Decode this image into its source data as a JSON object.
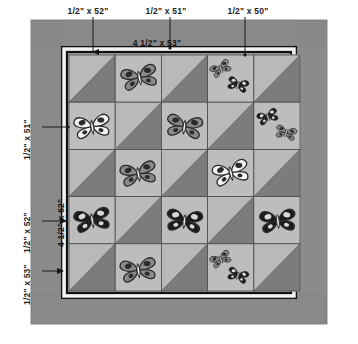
{
  "diagram": {
    "type": "quilt-assembly-diagram",
    "background_color": "#ffffff"
  },
  "labels": {
    "top": [
      {
        "text": "1/2\" x 52\"",
        "x": 88,
        "y": 6
      },
      {
        "text": "1/2\" x 51\"",
        "x": 166,
        "y": 6
      },
      {
        "text": "1/2\" x 50\"",
        "x": 248,
        "y": 6
      }
    ],
    "inner_top": {
      "text": "4 1/2\" x 53\"",
      "x": 157,
      "y": 38
    },
    "left": [
      {
        "text": "1/2\" x 51\"",
        "x": 22,
        "y": 160
      },
      {
        "text": "1/2\" x 52\"",
        "x": 22,
        "y": 253
      },
      {
        "text": "1/2\" x 53\"",
        "x": 22,
        "y": 305
      }
    ],
    "inner_left": {
      "text": "4 1/2\" x 62\"",
      "x": 56,
      "y": 247
    }
  },
  "colors": {
    "page": "#ffffff",
    "outer_border": "#8f8f8f",
    "outer_border_shade": "#848484",
    "rule_black": "#121212",
    "inner_white": "#f2f2f2",
    "block_light": "#b9b9b9",
    "block_light_alt": "#bdbdbd",
    "triangle_dark": "#7c7c7c",
    "grid_line": "#4a4a4a",
    "butterfly_white": "#f4f4f4",
    "butterfly_gray": "#8a8a8a",
    "butterfly_black": "#1c1c1c",
    "butterfly_outline": "#2a2a2a",
    "spot_dark": "#2b2b2b",
    "leader_line": "#1a1a1a"
  },
  "quilt": {
    "outer_border_rect": {
      "x": 31,
      "y": 20,
      "width": 296,
      "height": 304
    },
    "rule_outer_rect": {
      "x": 62,
      "y": 47,
      "width": 234,
      "height": 251
    },
    "white_strip_rect": {
      "x": 64,
      "y": 49,
      "width": 230,
      "height": 247
    },
    "rule_inner_rect": {
      "x": 67,
      "y": 52,
      "width": 224,
      "height": 241
    },
    "grid": {
      "x": 69,
      "y": 55,
      "cell_w": 46.2,
      "cell_h": 47.2,
      "cols": 5,
      "rows": 5
    }
  },
  "blocks": [
    {
      "row": 0,
      "col": 0,
      "kind": "triangle",
      "diagonal": "dark-lower-right",
      "butterflies": []
    },
    {
      "row": 0,
      "col": 1,
      "kind": "plain",
      "butterflies": [
        {
          "tone": "gray",
          "size": "large",
          "rot": -12,
          "cx": 0.52,
          "cy": 0.46
        }
      ]
    },
    {
      "row": 0,
      "col": 2,
      "kind": "triangle",
      "diagonal": "dark-lower-right",
      "butterflies": []
    },
    {
      "row": 0,
      "col": 3,
      "kind": "plain",
      "butterflies": [
        {
          "tone": "gray",
          "size": "small",
          "rot": -28,
          "cx": 0.28,
          "cy": 0.28
        },
        {
          "tone": "black",
          "size": "small",
          "rot": 16,
          "cx": 0.66,
          "cy": 0.62
        }
      ]
    },
    {
      "row": 0,
      "col": 4,
      "kind": "triangle",
      "diagonal": "dark-lower-right",
      "butterflies": []
    },
    {
      "row": 1,
      "col": 0,
      "kind": "plain",
      "butterflies": [
        {
          "tone": "white",
          "size": "large",
          "rot": -8,
          "cx": 0.5,
          "cy": 0.5
        }
      ]
    },
    {
      "row": 1,
      "col": 1,
      "kind": "triangle",
      "diagonal": "dark-lower-right",
      "butterflies": []
    },
    {
      "row": 1,
      "col": 2,
      "kind": "plain",
      "butterflies": [
        {
          "tone": "gray",
          "size": "large",
          "rot": 8,
          "cx": 0.5,
          "cy": 0.5
        }
      ]
    },
    {
      "row": 1,
      "col": 3,
      "kind": "triangle",
      "diagonal": "dark-lower-right",
      "butterflies": []
    },
    {
      "row": 1,
      "col": 4,
      "kind": "plain",
      "butterflies": [
        {
          "tone": "black",
          "size": "small",
          "rot": -20,
          "cx": 0.3,
          "cy": 0.3
        },
        {
          "tone": "gray",
          "size": "small",
          "rot": 14,
          "cx": 0.7,
          "cy": 0.64
        }
      ]
    },
    {
      "row": 2,
      "col": 0,
      "kind": "triangle",
      "diagonal": "dark-lower-right",
      "butterflies": []
    },
    {
      "row": 2,
      "col": 1,
      "kind": "plain",
      "butterflies": [
        {
          "tone": "gray",
          "size": "large",
          "rot": -10,
          "cx": 0.5,
          "cy": 0.5
        }
      ]
    },
    {
      "row": 2,
      "col": 2,
      "kind": "triangle",
      "diagonal": "dark-lower-right",
      "butterflies": []
    },
    {
      "row": 2,
      "col": 3,
      "kind": "plain",
      "butterflies": [
        {
          "tone": "white",
          "size": "large",
          "rot": -14,
          "cx": 0.5,
          "cy": 0.48
        }
      ]
    },
    {
      "row": 2,
      "col": 4,
      "kind": "triangle",
      "diagonal": "dark-lower-right",
      "butterflies": []
    },
    {
      "row": 3,
      "col": 0,
      "kind": "plain",
      "butterflies": [
        {
          "tone": "black",
          "size": "large",
          "rot": -10,
          "cx": 0.5,
          "cy": 0.48
        }
      ]
    },
    {
      "row": 3,
      "col": 1,
      "kind": "triangle",
      "diagonal": "dark-lower-right",
      "butterflies": []
    },
    {
      "row": 3,
      "col": 2,
      "kind": "plain",
      "butterflies": [
        {
          "tone": "black",
          "size": "large",
          "rot": 6,
          "cx": 0.5,
          "cy": 0.5
        }
      ]
    },
    {
      "row": 3,
      "col": 3,
      "kind": "triangle",
      "diagonal": "dark-lower-right",
      "butterflies": []
    },
    {
      "row": 3,
      "col": 4,
      "kind": "plain",
      "butterflies": [
        {
          "tone": "black",
          "size": "large",
          "rot": -6,
          "cx": 0.52,
          "cy": 0.5
        }
      ]
    },
    {
      "row": 4,
      "col": 0,
      "kind": "triangle",
      "diagonal": "dark-lower-right",
      "butterflies": []
    },
    {
      "row": 4,
      "col": 1,
      "kind": "plain",
      "butterflies": [
        {
          "tone": "gray",
          "size": "large",
          "rot": -8,
          "cx": 0.5,
          "cy": 0.54
        }
      ]
    },
    {
      "row": 4,
      "col": 2,
      "kind": "triangle",
      "diagonal": "dark-lower-right",
      "butterflies": []
    },
    {
      "row": 4,
      "col": 3,
      "kind": "plain",
      "butterflies": [
        {
          "tone": "gray",
          "size": "small",
          "rot": -25,
          "cx": 0.28,
          "cy": 0.32
        },
        {
          "tone": "black",
          "size": "small",
          "rot": 18,
          "cx": 0.66,
          "cy": 0.66
        }
      ]
    },
    {
      "row": 4,
      "col": 4,
      "kind": "triangle",
      "diagonal": "dark-lower-right",
      "butterflies": []
    }
  ],
  "leaders": {
    "top": [
      {
        "name": "leader-52",
        "x": 93,
        "y1": 17,
        "y2": 52,
        "arrow": true
      },
      {
        "name": "leader-51",
        "x": 170,
        "y1": 17,
        "y2": 48,
        "arrow": false
      },
      {
        "name": "leader-50",
        "x": 245,
        "y1": 17,
        "y2": 55,
        "arrow": false
      }
    ],
    "left": [
      {
        "name": "leader-51-left",
        "y": 127,
        "x1": 42,
        "x2": 68,
        "arrow": false
      },
      {
        "name": "leader-52-left",
        "y": 221,
        "x1": 42,
        "x2": 66,
        "arrow": true
      },
      {
        "name": "leader-53-left",
        "y": 271,
        "x1": 42,
        "x2": 63,
        "arrow": true
      }
    ]
  }
}
